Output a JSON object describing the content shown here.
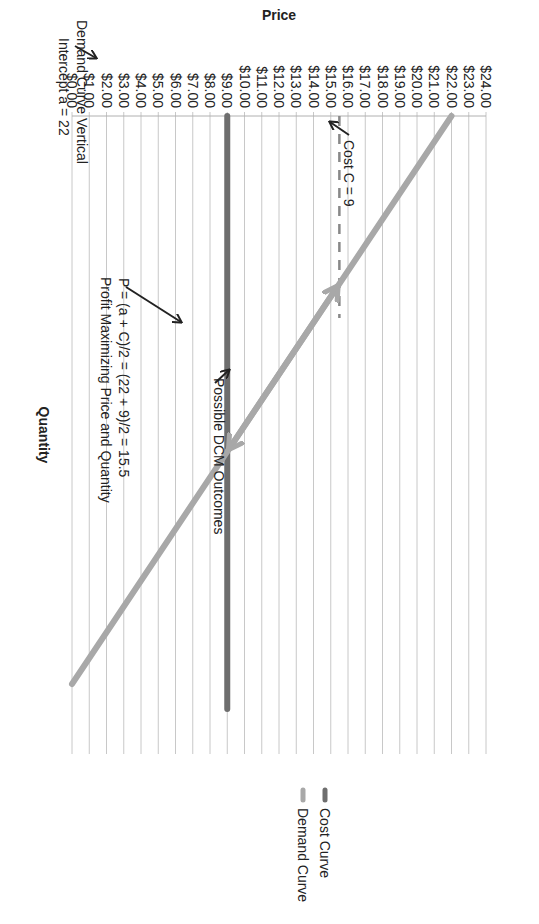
{
  "chart_data": {
    "type": "line",
    "orientation_note": "figure rotated 90 degrees clockwise on page",
    "title": "",
    "xlabel": "Quantity",
    "ylabel": "Price",
    "ylim": [
      0,
      24
    ],
    "y_ticks": [
      "$0.00",
      "$1.00",
      "$2.00",
      "$3.00",
      "$4.00",
      "$5.00",
      "$6.00",
      "$7.00",
      "$8.00",
      "$9.00",
      "$10.00",
      "$11.00",
      "$12.00",
      "$13.00",
      "$14.00",
      "$15.00",
      "$16.00",
      "$17.00",
      "$18.00",
      "$19.00",
      "$20.00",
      "$21.00",
      "$22.00",
      "$23.00",
      "$24.00"
    ],
    "grid": true,
    "legend_position": "right",
    "series": [
      {
        "name": "Demand Curve",
        "color": "#a8a8a8",
        "x": [
          0,
          1
        ],
        "values": [
          22,
          0
        ]
      },
      {
        "name": "Cost Curve",
        "color": "#6e6e6e",
        "x": [
          0,
          1
        ],
        "values": [
          9,
          9
        ]
      }
    ],
    "reference_lines": [
      {
        "type": "dashed-vertical",
        "price": 15.5,
        "color": "#888888"
      }
    ],
    "annotations": [
      {
        "lines": [
          "Demand Curve Vertical",
          "Intercept a = 22"
        ]
      },
      {
        "lines": [
          "Profit Maximizing Price and Quantity",
          "P = (a + C)/2 = (22 + 9)/2 = 15.5"
        ]
      },
      {
        "lines": [
          "Possible DCM Outcomes"
        ]
      },
      {
        "lines": [
          "Cost C = 9"
        ]
      }
    ]
  },
  "legend": {
    "items": [
      {
        "label": "Demand Curve",
        "color": "#a8a8a8"
      },
      {
        "label": "Cost Curve",
        "color": "#6e6e6e"
      }
    ]
  },
  "axes": {
    "x_title": "Quantity",
    "y_title": "Price"
  },
  "annotations": {
    "intercept_line1": "Demand Curve Vertical",
    "intercept_line2": "Intercept a = 22",
    "profit_line1": "Profit Maximizing Price and Quantity",
    "profit_line2": "P = (a + C)/2 = (22 + 9)/2 = 15.5",
    "dcm": "Possible DCM Outcomes",
    "cost": "Cost C = 9"
  }
}
